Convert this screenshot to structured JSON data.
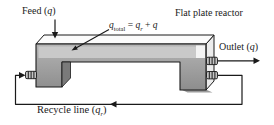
{
  "figure": {
    "type": "process-flow-diagram",
    "title": "Flat plate reactor",
    "labels": {
      "feed": {
        "pre": "Feed (",
        "var": "q",
        "post": ")"
      },
      "qtotal": {
        "var1": "q",
        "sub1": "total",
        "eq": " = ",
        "var2": "q",
        "sub2": "r",
        "plus": " + ",
        "var3": "q"
      },
      "outlet": {
        "pre": "Outlet (",
        "var": "q",
        "post": ")"
      },
      "recycle": {
        "pre": "Recycle line (",
        "var": "q",
        "sub": "r",
        "post": ")"
      }
    },
    "streams": {
      "feed": "q",
      "outlet": "q",
      "recycle": "qr",
      "total_in_reactor": "qtotal = qr + q"
    },
    "colors": {
      "background": "#ffffff",
      "outline": "#1a1a1a",
      "top_face": "#fbfbfb",
      "side_face": "#ececec",
      "front_light": "#b4b4b4",
      "front_dark": "#8d8d8d",
      "liquid_band": "#c9c9c9",
      "liquid_highlight": "#f3f3f3",
      "notch_face": "#7a7a7a",
      "fitting_fill": "#c4c4c4",
      "shadow": "#9b9b9b"
    }
  }
}
